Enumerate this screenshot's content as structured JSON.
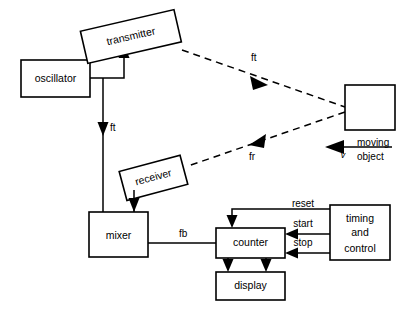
{
  "diagram": {
    "blocks": {
      "oscillator": "oscillator",
      "transmitter": "transmitter",
      "receiver": "receiver",
      "mixer": "mixer",
      "counter": "counter",
      "display": "display",
      "timing": {
        "line1": "timing",
        "line2": "and",
        "line3": "control"
      },
      "moving_object": {
        "line1": "moving",
        "line2": "object"
      }
    },
    "signals": {
      "ft_osc": "ft",
      "ft_transmitted": "ft",
      "fr_received": "fr",
      "fb_beat": "fb",
      "reset": "reset",
      "start": "start",
      "stop": "stop",
      "velocity": "v"
    },
    "colors": {
      "ink": "#000000",
      "paper": "#ffffff"
    }
  }
}
